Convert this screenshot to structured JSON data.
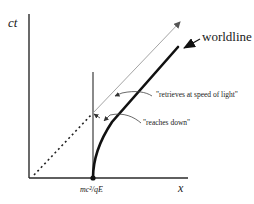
{
  "diagram": {
    "type": "spacetime-diagram",
    "axes": {
      "vertical_label": "ct",
      "horizontal_label": "x",
      "x_tick_label": "mc²/qE"
    },
    "annotations": {
      "worldline": "worldline",
      "retrieves": "\"retrieves at speed of light\"",
      "reaches": "\"reaches down\""
    },
    "colors": {
      "axis": "#2a2a2a",
      "worldline": "#111111",
      "light_ray": "#9a9a9a",
      "dashed": "#222222"
    }
  }
}
